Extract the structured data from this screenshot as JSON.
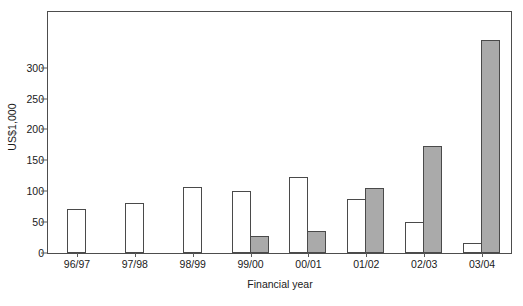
{
  "chart_data": {
    "type": "bar",
    "title": "",
    "subtitle": "",
    "xlabel": "Financial year",
    "ylabel": "US$1,000",
    "categories": [
      "96/97",
      "97/98",
      "98/99",
      "99/00",
      "00/01",
      "01/02",
      "02/03",
      "03/04"
    ],
    "series": [
      {
        "name": "white-series",
        "color": "#ffffff",
        "values": [
          71,
          81,
          107,
          100,
          123,
          87,
          51,
          16
        ]
      },
      {
        "name": "gray-series",
        "color": "#aaaaaa",
        "values": [
          null,
          null,
          null,
          28,
          35,
          105,
          173,
          345
        ]
      }
    ],
    "ylim": [
      0,
      390
    ],
    "yticks": [
      0,
      50,
      100,
      150,
      200,
      250,
      300
    ],
    "ytick_labels": [
      "0",
      "50",
      "100",
      "150",
      "200",
      "250",
      "300"
    ],
    "grid": false,
    "legend": "none",
    "frame": true,
    "bar_border_color": "#4a4a4a",
    "axis_color": "#4d4d4d"
  }
}
